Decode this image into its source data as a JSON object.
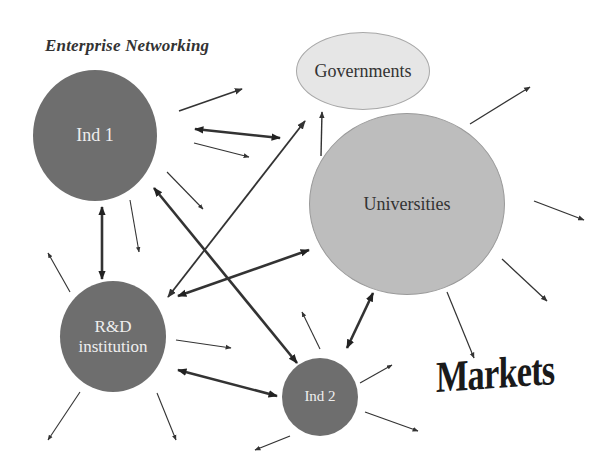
{
  "title": "Enterprise Networking",
  "nodes": {
    "ind1": "Ind 1",
    "ind2": "Ind 2",
    "rnd_line1": "R&D",
    "rnd_line2": "institution",
    "universities": "Universities",
    "governments": "Governments",
    "markets": "Markets"
  },
  "colors": {
    "dark_node": "#6e6e6e",
    "universities": "#bdbdbd",
    "governments": "#e6e6e6",
    "arrow": "#333333"
  }
}
